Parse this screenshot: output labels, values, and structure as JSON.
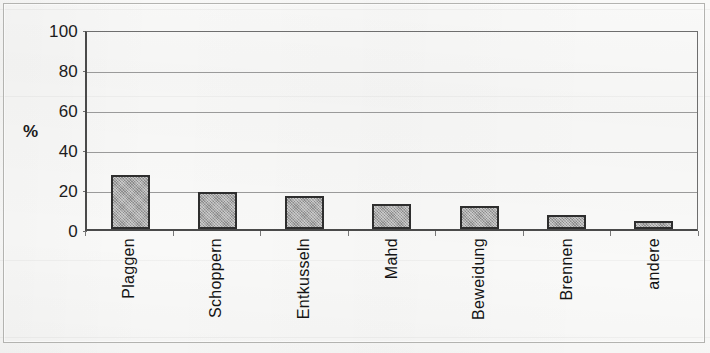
{
  "figure": {
    "y_axis_title": "%",
    "frame": "scanned-bordered-figure"
  },
  "chart_data": {
    "type": "bar",
    "title": "",
    "subtitle": "",
    "xlabel": "",
    "ylabel": "%",
    "categories": [
      "Plaggen",
      "Schoppern",
      "Entkusseln",
      "Mahd",
      "Beweidung",
      "Brennen",
      "andere"
    ],
    "values": [
      27,
      18.5,
      16.5,
      12.5,
      11.5,
      7,
      4
    ],
    "ylim": [
      0,
      100
    ],
    "yticks": [
      0,
      20,
      40,
      60,
      80,
      100
    ],
    "ytick_labels": [
      "0",
      "20",
      "40",
      "60",
      "80",
      "100"
    ],
    "grid": "horizontal",
    "legend": "none",
    "bar_fill": "#9d9d9d",
    "bar_edge": "#2e2e2e",
    "axis_color": "#4a4a4a",
    "gridline_color": "#9a9a9a",
    "background": "#f9f9f8"
  }
}
